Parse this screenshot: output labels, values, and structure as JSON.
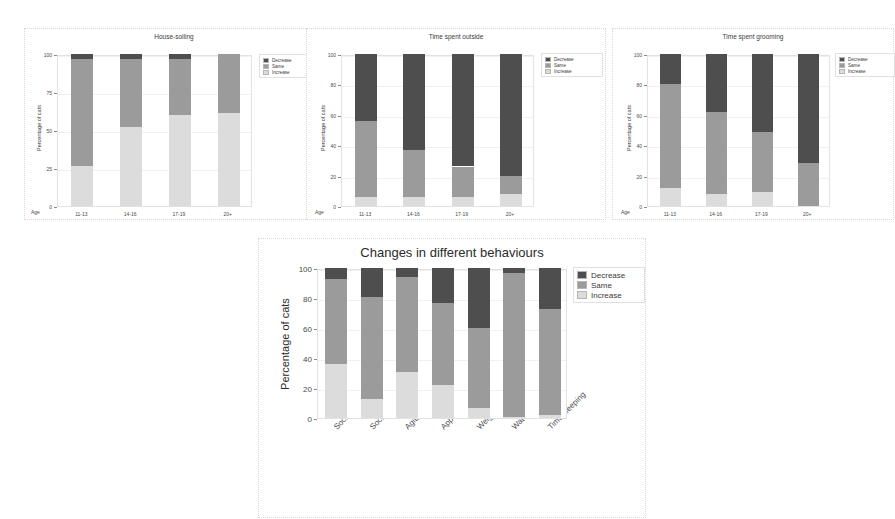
{
  "figure": {
    "background": "#ffffff",
    "colors": {
      "decrease": "#4e4e4e",
      "same": "#9b9b9b",
      "increase": "#dcdcdc",
      "panel_border": "#d8d8d8",
      "axis": "#8a8a8a",
      "text": "#3a3a3a"
    },
    "legend_entries": [
      "Decrease",
      "Same",
      "Increase"
    ]
  },
  "chart_data": [
    {
      "id": "house-soiling",
      "type": "bar",
      "stacked": true,
      "title": "House-soiling",
      "xlabel": "Age",
      "ylabel": "Percentage of cats",
      "categories": [
        "11-13",
        "14-16",
        "17-19",
        "20+"
      ],
      "yticks": [
        0,
        25,
        50,
        75,
        100
      ],
      "ylim": [
        0,
        100
      ],
      "grid": true,
      "legend_position": "right",
      "series": [
        {
          "name": "Increase",
          "color": "#dcdcdc",
          "values": [
            26,
            52,
            60,
            61
          ]
        },
        {
          "name": "Same",
          "color": "#9b9b9b",
          "values": [
            71,
            45,
            37,
            39
          ]
        },
        {
          "name": "Decrease",
          "color": "#4e4e4e",
          "values": [
            3,
            3,
            3,
            0
          ]
        }
      ]
    },
    {
      "id": "time-spent-outside",
      "type": "bar",
      "stacked": true,
      "title": "Time spent outside",
      "xlabel": "Age",
      "ylabel": "Percentage of cats",
      "categories": [
        "11-13",
        "14-16",
        "17-19",
        "20+"
      ],
      "yticks": [
        0,
        20,
        40,
        60,
        80,
        100
      ],
      "ylim": [
        0,
        100
      ],
      "grid": true,
      "legend_position": "right",
      "series": [
        {
          "name": "Increase",
          "color": "#dcdcdc",
          "values": [
            6,
            6,
            6,
            8
          ]
        },
        {
          "name": "Same",
          "color": "#9b9b9b",
          "values": [
            50,
            31,
            20,
            12
          ]
        },
        {
          "name": "Decrease",
          "color": "#4e4e4e",
          "values": [
            44,
            63,
            74,
            80
          ]
        }
      ]
    },
    {
      "id": "time-spent-grooming",
      "type": "bar",
      "stacked": true,
      "title": "Time spent grooming",
      "xlabel": "Age",
      "ylabel": "Percentage of cats",
      "categories": [
        "11-13",
        "14-16",
        "17-19",
        "20+"
      ],
      "yticks": [
        0,
        20,
        40,
        60,
        80,
        100
      ],
      "ylim": [
        0,
        100
      ],
      "grid": true,
      "legend_position": "right",
      "series": [
        {
          "name": "Increase",
          "color": "#dcdcdc",
          "values": [
            12,
            8,
            9,
            0
          ]
        },
        {
          "name": "Same",
          "color": "#9b9b9b",
          "values": [
            68,
            54,
            40,
            28
          ]
        },
        {
          "name": "Decrease",
          "color": "#4e4e4e",
          "values": [
            20,
            38,
            51,
            72
          ]
        }
      ]
    },
    {
      "id": "changes-in-different-behaviours",
      "type": "bar",
      "stacked": true,
      "title": "Changes in different behaviours",
      "xlabel": "",
      "ylabel": "Percentage of cats",
      "categories": [
        "Sociable with people",
        "Sociable with animals",
        "Agitation",
        "Appetite",
        "Weight",
        "Water intake",
        "Time sleeping"
      ],
      "yticks": [
        0,
        20,
        40,
        60,
        80,
        100
      ],
      "ylim": [
        0,
        100
      ],
      "grid": true,
      "legend_position": "right",
      "series": [
        {
          "name": "Increase",
          "color": "#dcdcdc",
          "values": [
            36,
            13,
            31,
            22,
            7,
            1,
            2
          ]
        },
        {
          "name": "Same",
          "color": "#9b9b9b",
          "values": [
            57,
            68,
            63,
            55,
            53,
            96,
            71
          ]
        },
        {
          "name": "Decrease",
          "color": "#4e4e4e",
          "values": [
            7,
            19,
            6,
            23,
            40,
            3,
            27
          ]
        }
      ]
    }
  ]
}
